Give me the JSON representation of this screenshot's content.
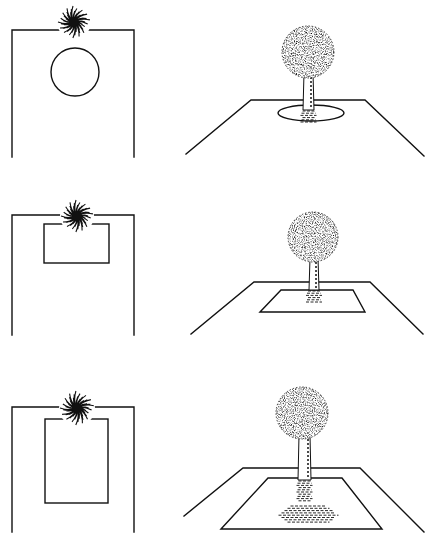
{
  "figure": {
    "colors": {
      "ink": "#111111",
      "background": "#ffffff"
    },
    "rows": [
      {
        "id": "row-1",
        "opening_shape": "circle",
        "plan": {
          "frame": [
            12,
            30,
            134,
            157
          ],
          "opening": {
            "type": "circle",
            "cx": 75,
            "cy": 72,
            "r": 24
          },
          "tree": {
            "cx": 74,
            "cy": 22,
            "r": 16
          }
        },
        "perspective": {
          "plane": [
            [
              186,
              154
            ],
            [
              251,
              100
            ],
            [
              365,
              100
            ],
            [
              424,
              156
            ]
          ],
          "opening": {
            "type": "ellipse",
            "cx": 311,
            "cy": 113,
            "rx": 33,
            "ry": 8
          },
          "crown": {
            "cx": 308,
            "cy": 52,
            "r": 26
          },
          "trunk": {
            "x1": 304,
            "x2": 313,
            "y1": 73,
            "y2": 110
          }
        }
      },
      {
        "id": "row-2",
        "opening_shape": "small-rectangle",
        "plan": {
          "frame": [
            12,
            215,
            134,
            335
          ],
          "opening": {
            "type": "rect",
            "x": 44,
            "y": 224,
            "w": 65,
            "h": 39
          },
          "tree": {
            "cx": 77,
            "cy": 216,
            "r": 16
          }
        },
        "perspective": {
          "plane": [
            [
              191,
              334
            ],
            [
              254,
              282
            ],
            [
              370,
              282
            ],
            [
              423,
              334
            ]
          ],
          "opening": {
            "type": "quad",
            "points": [
              [
                260,
                312
              ],
              [
                281,
                290
              ],
              [
                353,
                290
              ],
              [
                365,
                312
              ]
            ]
          },
          "crown": {
            "cx": 313,
            "cy": 237,
            "r": 25
          },
          "trunk": {
            "x1": 310,
            "x2": 318,
            "y1": 258,
            "y2": 290
          }
        }
      },
      {
        "id": "row-3",
        "opening_shape": "large-rectangle",
        "plan": {
          "frame": [
            12,
            407,
            134,
            532
          ],
          "opening": {
            "type": "rect",
            "x": 45,
            "y": 419,
            "w": 63,
            "h": 84
          },
          "tree": {
            "cx": 77,
            "cy": 408,
            "r": 17
          }
        },
        "perspective": {
          "plane": [
            [
              184,
              516
            ],
            [
              243,
              468
            ],
            [
              360,
              468
            ],
            [
              424,
              532
            ]
          ],
          "opening": {
            "type": "quad",
            "points": [
              [
                221,
                529
              ],
              [
                268,
                478
              ],
              [
                342,
                478
              ],
              [
                382,
                529
              ]
            ]
          },
          "crown": {
            "cx": 302,
            "cy": 413,
            "r": 26
          },
          "trunk": {
            "x1": 299,
            "x2": 310,
            "y1": 435,
            "y2": 480
          }
        }
      }
    ]
  }
}
